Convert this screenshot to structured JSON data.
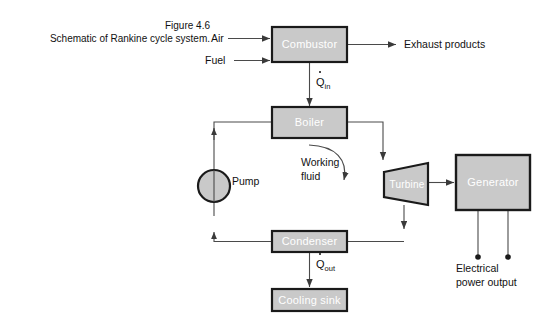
{
  "figure": {
    "caption_line1": "Figure 4.6",
    "caption_line2": "Schematic of Rankine cycle system.",
    "background_color": "#ffffff",
    "box_fill_color": "#c9c9c9",
    "box_border_color": "#1a1a1a",
    "box_text_color": "#ffffff",
    "line_color": "#444444"
  },
  "blocks": {
    "combustor": "Combustor",
    "boiler": "Boiler",
    "turbine": "Turbine",
    "generator": "Generator",
    "condenser": "Condenser",
    "cooling_sink": "Cooling sink",
    "pump": "Pump"
  },
  "labels": {
    "air": "Air",
    "fuel": "Fuel",
    "exhaust_products": "Exhaust products",
    "working_fluid": "Working\nfluid",
    "electrical_power_output": "Electrical\npower output",
    "q_in_symbol": "Q",
    "q_in_subscript": "in",
    "q_out_symbol": "Q",
    "q_out_subscript": "out"
  }
}
